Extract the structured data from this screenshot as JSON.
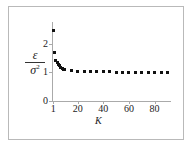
{
  "figure": {
    "background": "#ffffff",
    "frame_color": "#b9b9b9",
    "axis_color": "#aaaaaa",
    "marker_color": "#111111"
  },
  "axis": {
    "x_title": "K",
    "y_numerator": "ε",
    "y_denominator": "σ",
    "y_denominator_exponent": "2",
    "x_ticks": [
      "1",
      "20",
      "40",
      "60",
      "80"
    ],
    "y_ticks": [
      "0",
      "1",
      "2"
    ]
  },
  "chart_data": {
    "type": "scatter",
    "title": "",
    "xlabel": "K",
    "ylabel": "ε/σ²",
    "xlim": [
      0,
      92
    ],
    "ylim": [
      0,
      2.75
    ],
    "xticks": [
      1,
      20,
      40,
      60,
      80
    ],
    "yticks": [
      0,
      1,
      2
    ],
    "grid": false,
    "legend": null,
    "series": [
      {
        "name": "epsilon over sigma squared",
        "marker": "square",
        "x": [
          1,
          2,
          3,
          4,
          5,
          6,
          7,
          8,
          9,
          10,
          15,
          20,
          25,
          30,
          35,
          40,
          45,
          50,
          55,
          60,
          65,
          70,
          75,
          80,
          85,
          90
        ],
        "y": [
          2.45,
          1.7,
          1.42,
          1.33,
          1.27,
          1.22,
          1.18,
          1.14,
          1.11,
          1.08,
          1.05,
          1.03,
          1.02,
          1.02,
          1.01,
          1.01,
          1.01,
          1.0,
          1.0,
          1.0,
          1.0,
          1.0,
          1.0,
          1.0,
          1.0,
          1.0
        ]
      }
    ]
  }
}
